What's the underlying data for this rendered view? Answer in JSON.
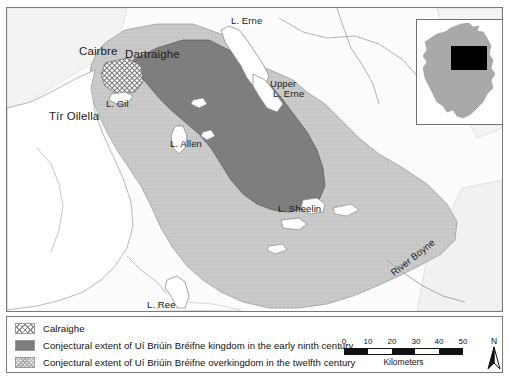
{
  "map": {
    "region_labels": [
      {
        "id": "cairbre",
        "text": "Cairbre",
        "x": 72,
        "y": 41
      },
      {
        "id": "dartraighe",
        "text": "Dartraighe",
        "x": 118,
        "y": 41
      },
      {
        "id": "tir-oilella",
        "text": "Tír Oilella",
        "x": 42,
        "y": 110
      }
    ],
    "water_labels": [
      {
        "id": "l-erne",
        "text": "L. Erne",
        "x": 227,
        "y": 13
      },
      {
        "id": "upper-l-erne",
        "text": "Upper",
        "x": 265,
        "y": 76
      },
      {
        "id": "upper-l-erne2",
        "text": "L. Erne",
        "x": 268,
        "y": 85
      },
      {
        "id": "l-gil",
        "text": "L. Gil",
        "x": 102,
        "y": 92
      },
      {
        "id": "l-allen",
        "text": "L. Allen",
        "x": 165,
        "y": 140
      },
      {
        "id": "l-sheelin",
        "text": "L. Sheelin",
        "x": 275,
        "y": 205
      },
      {
        "id": "l-ree",
        "text": "L. Ree",
        "x": 145,
        "y": 302
      }
    ],
    "river_labels": [
      {
        "id": "river-boyne",
        "text": "River Boyne",
        "x": 390,
        "y": 277
      }
    ],
    "inset": {
      "name": "ireland-inset",
      "extent_box_label": "study-area-extent"
    }
  },
  "legend": {
    "items": [
      {
        "id": "calraighe",
        "pattern": "crosshatch",
        "label": "Calraighe"
      },
      {
        "id": "kingdom",
        "pattern": "solid-gray",
        "label": "Conjectural extent of Uí Briúin Bréifne kingdom in the early ninth century"
      },
      {
        "id": "overkingdom",
        "pattern": "stipple",
        "label": "Conjectural extent of Uí Briúin Bréifne overkingdom in the twelfth century"
      }
    ]
  },
  "scalebar": {
    "ticks": [
      "0",
      "10",
      "20",
      "30",
      "40",
      "50"
    ],
    "units": "Kilometers",
    "segments": [
      "on",
      "off",
      "on",
      "off",
      "on"
    ]
  },
  "north_arrow": {
    "letter": "N"
  },
  "colors": {
    "kingdom_fill": "#7e7e7e",
    "overkingdom_fill": "#c9c9c9",
    "land_fill": "#e9e9e9",
    "water_fill": "#ffffff",
    "inset_land": "#a9a9a9",
    "inset_box": "#000000",
    "frame_stroke": "#7a7a7a"
  }
}
